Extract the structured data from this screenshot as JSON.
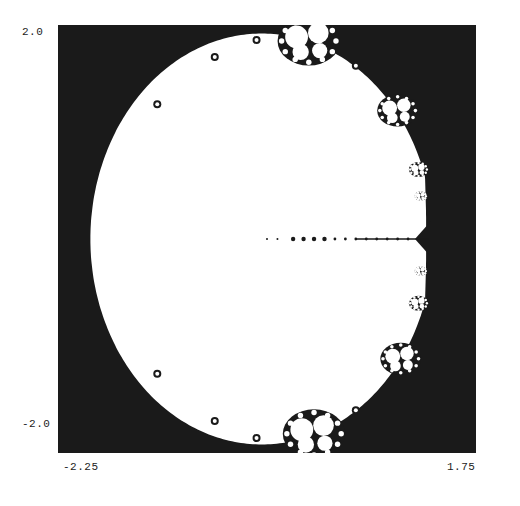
{
  "figure": {
    "colors": {
      "exterior": "#1a1a1a",
      "interior": "#ffffff",
      "label": "#222222"
    }
  },
  "axes": {
    "y_max_label": "2.0",
    "y_min_label": "-2.0",
    "x_min_label": "-2.25",
    "x_max_label": "1.75",
    "x_range": [
      -2.25,
      1.75
    ],
    "y_range": [
      -2.0,
      2.0
    ]
  },
  "shape": {
    "center": [
      -0.3,
      0.0
    ],
    "radius_x": 1.64,
    "radius_y": 1.92,
    "cusp_x": 1.3,
    "bulbs": [
      {
        "name": "top-bulb",
        "x": 0.15,
        "y": 1.85,
        "r": 0.26
      },
      {
        "name": "bottom-bulb",
        "x": 0.2,
        "y": -1.82,
        "r": 0.26
      },
      {
        "name": "upper-right-bulb",
        "x": 1.0,
        "y": 1.2,
        "r": 0.17
      },
      {
        "name": "lower-right-bulb",
        "x": 1.03,
        "y": -1.12,
        "r": 0.17
      },
      {
        "name": "right-bulb-1",
        "x": 1.2,
        "y": 0.65,
        "r": 0.08
      },
      {
        "name": "right-bulb-2",
        "x": 1.2,
        "y": -0.6,
        "r": 0.08
      },
      {
        "name": "right-bulb-3",
        "x": 1.22,
        "y": 0.4,
        "r": 0.05
      },
      {
        "name": "right-bulb-4",
        "x": 1.22,
        "y": -0.3,
        "r": 0.05
      }
    ],
    "spike_points_x": [
      -0.25,
      -0.15,
      0.0,
      0.1,
      0.2,
      0.3,
      0.4,
      0.5,
      0.6,
      0.7,
      0.8,
      0.9,
      1.0,
      1.1,
      1.2
    ],
    "edge_buds": [
      {
        "x": -1.3,
        "y": 1.26
      },
      {
        "x": -0.75,
        "y": 1.7
      },
      {
        "x": -0.35,
        "y": 1.86
      },
      {
        "x": -1.3,
        "y": -1.26
      },
      {
        "x": -0.75,
        "y": -1.7
      },
      {
        "x": -0.35,
        "y": -1.86
      },
      {
        "x": 0.6,
        "y": 1.62
      },
      {
        "x": 0.6,
        "y": -1.6
      }
    ]
  }
}
